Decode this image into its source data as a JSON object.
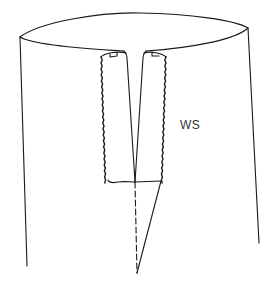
{
  "diagram": {
    "type": "sewing-construction-illustration",
    "labels": [
      {
        "id": "ws",
        "text": "WS",
        "meaning_hint": "wrong side",
        "x": 180,
        "y": 118
      }
    ],
    "elements": [
      {
        "name": "tube-top-ellipse"
      },
      {
        "name": "left-side-edge"
      },
      {
        "name": "right-side-edge"
      },
      {
        "name": "slit-left-edge"
      },
      {
        "name": "slit-right-edge"
      },
      {
        "name": "left-seam-allowance-stitching"
      },
      {
        "name": "right-seam-allowance-stitching"
      },
      {
        "name": "slit-bottom-stitch-line"
      },
      {
        "name": "center-fold-dashed-line"
      },
      {
        "name": "dart-diagonal-line"
      }
    ],
    "colors": {
      "line": "#1a1a1a",
      "background": "#ffffff"
    }
  }
}
